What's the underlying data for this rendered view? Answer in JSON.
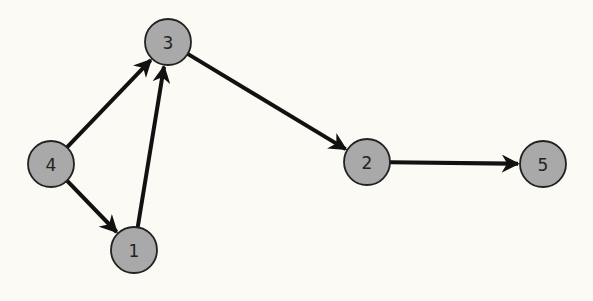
{
  "graph": {
    "type": "directed",
    "node_radius": 23,
    "colors": {
      "node_fill": "#a9a9a9",
      "node_stroke": "#222222",
      "edge": "#111111",
      "background": "#fbfaf5"
    },
    "nodes": [
      {
        "id": "1",
        "label": "1",
        "x": 134,
        "y": 250
      },
      {
        "id": "2",
        "label": "2",
        "x": 367,
        "y": 162
      },
      {
        "id": "3",
        "label": "3",
        "x": 168,
        "y": 42
      },
      {
        "id": "4",
        "label": "4",
        "x": 51,
        "y": 164
      },
      {
        "id": "5",
        "label": "5",
        "x": 543,
        "y": 164
      }
    ],
    "edges": [
      {
        "from": "4",
        "to": "3"
      },
      {
        "from": "4",
        "to": "1"
      },
      {
        "from": "1",
        "to": "3"
      },
      {
        "from": "3",
        "to": "2"
      },
      {
        "from": "2",
        "to": "5"
      }
    ]
  }
}
